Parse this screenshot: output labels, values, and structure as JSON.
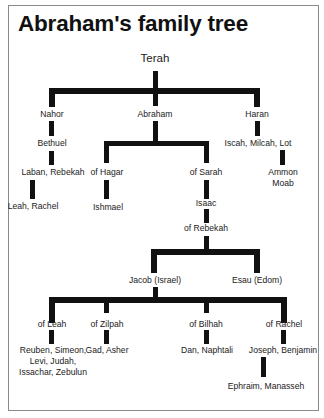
{
  "title": "Abraham's family tree",
  "nodes": {
    "terah": "Terah",
    "nahor": "Nahor",
    "abraham": "Abraham",
    "haran": "Haran",
    "bethuel": "Bethuel",
    "laban_rebekah": "Laban, Rebekah",
    "leah_rachel": "Leah, Rachel",
    "of_hagar": "of Hagar",
    "ishmael": "Ishmael",
    "of_sarah": "of Sarah",
    "isaac": "Isaac",
    "of_rebekah": "of Rebekah",
    "iscah_milcah_lot": "Iscah, Milcah, Lot",
    "ammon": "Ammon",
    "moab": "Moab",
    "jacob": "Jacob (Israel)",
    "esau": "Esau (Edom)",
    "of_leah": "of Leah",
    "of_zilpah": "of Zilpah",
    "of_bilhah": "of Bilhah",
    "of_rachel": "of Rachel",
    "leah_sons_1": "Reuben, Simeon,",
    "leah_sons_2": "Levi, Judah,",
    "leah_sons_3": "Issachar, Zebulun",
    "zilpah_sons": "Gad, Asher",
    "bilhah_sons": "Dan, Naphtali",
    "rachel_sons": "Joseph, Benjamin",
    "joseph_sons": "Ephraim, Manasseh"
  },
  "colors": {
    "line": "#111111",
    "border": "#8a8a8a",
    "background": "#ffffff"
  }
}
